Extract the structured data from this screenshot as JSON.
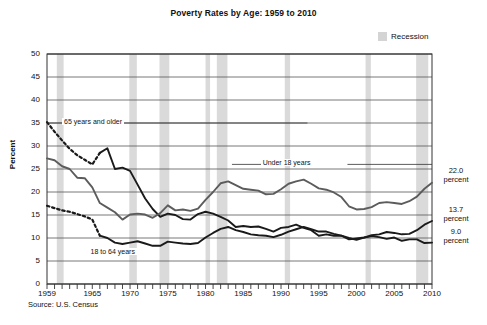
{
  "title": "Poverty Rates by Age: 1959 to 2010",
  "source": "Source: U.S. Census",
  "legend": {
    "recession_label": "Recession",
    "recession_color": "#d4d4d4"
  },
  "axes": {
    "y_title": "Percent",
    "y_ticks": [
      "50",
      "45",
      "40",
      "35",
      "30",
      "25",
      "20",
      "15",
      "10",
      "5",
      "0"
    ],
    "x_ticks": [
      "1959",
      "1965",
      "1970",
      "1975",
      "1980",
      "1985",
      "1990",
      "1995",
      "2000",
      "2005",
      "2010"
    ]
  },
  "series_labels": {
    "older": "65 years and older",
    "under18": "Under 18 years",
    "adults": "18 to 64 years"
  },
  "end_values": {
    "under18": "22.0",
    "under18_unit": "percent",
    "adults": "13.7",
    "adults_unit": "percent",
    "older": "9.0",
    "older_unit": "percent"
  },
  "chart_data": {
    "type": "line",
    "title": "Poverty Rates by Age: 1959 to 2010",
    "xlabel": "",
    "ylabel": "Percent",
    "xlim": [
      1959,
      2010
    ],
    "ylim": [
      0,
      50
    ],
    "ytick_step": 5,
    "grid": "horizontal",
    "legend_position": "top-right",
    "legend_entries": [
      "Recession"
    ],
    "annotations": [
      {
        "text": "65 years and older",
        "x": 1963,
        "y": 35
      },
      {
        "text": "Under 18 years",
        "x": 1988,
        "y": 26
      },
      {
        "text": "18 to 64 years",
        "x": 1967,
        "y": 7
      },
      {
        "text": "22.0 percent",
        "x": 2010.8,
        "y": 22.0
      },
      {
        "text": "13.7 percent",
        "x": 2010.8,
        "y": 13.7
      },
      {
        "text": "9.0 percent",
        "x": 2010.8,
        "y": 9.0
      }
    ],
    "recession_bands": [
      [
        1960.3,
        1961.2
      ],
      [
        1969.9,
        1970.9
      ],
      [
        1973.9,
        1975.2
      ],
      [
        1980.0,
        1980.6
      ],
      [
        1981.5,
        1982.9
      ],
      [
        1990.5,
        1991.2
      ],
      [
        2001.2,
        2001.9
      ],
      [
        2007.9,
        2009.5
      ]
    ],
    "x": [
      1959,
      1960,
      1961,
      1962,
      1963,
      1964,
      1965,
      1966,
      1967,
      1968,
      1969,
      1970,
      1971,
      1972,
      1973,
      1974,
      1975,
      1976,
      1977,
      1978,
      1979,
      1980,
      1981,
      1982,
      1983,
      1984,
      1985,
      1986,
      1987,
      1988,
      1989,
      1990,
      1991,
      1992,
      1993,
      1994,
      1995,
      1996,
      1997,
      1998,
      1999,
      2000,
      2001,
      2002,
      2003,
      2004,
      2005,
      2006,
      2007,
      2008,
      2009,
      2010
    ],
    "series": [
      {
        "name": "65 years and older",
        "color": "#1a1a1a",
        "dashed_until": 1966,
        "values": [
          35.2,
          33.1,
          31.2,
          29.4,
          28.0,
          27.0,
          26.0,
          28.5,
          29.5,
          25.0,
          25.3,
          24.6,
          21.6,
          18.6,
          16.3,
          14.6,
          15.3,
          15.0,
          14.1,
          14.0,
          15.2,
          15.7,
          15.3,
          14.6,
          13.8,
          12.4,
          12.6,
          12.4,
          12.5,
          12.0,
          11.4,
          12.2,
          12.4,
          12.9,
          12.2,
          11.7,
          10.5,
          10.8,
          10.5,
          10.5,
          9.7,
          9.9,
          10.1,
          10.4,
          10.2,
          9.8,
          10.1,
          9.4,
          9.7,
          9.7,
          8.9,
          9.0
        ]
      },
      {
        "name": "Under 18 years",
        "color": "#5c5c5c",
        "dashed_until": 1959,
        "values": [
          27.3,
          26.9,
          25.6,
          25.0,
          23.1,
          23.0,
          21.0,
          17.6,
          16.6,
          15.6,
          14.0,
          15.1,
          15.3,
          15.1,
          14.4,
          15.4,
          17.1,
          16.0,
          16.2,
          15.9,
          16.4,
          18.3,
          20.0,
          21.9,
          22.3,
          21.5,
          20.7,
          20.5,
          20.3,
          19.5,
          19.6,
          20.6,
          21.8,
          22.3,
          22.7,
          21.8,
          20.8,
          20.5,
          19.9,
          18.9,
          16.9,
          16.2,
          16.3,
          16.7,
          17.6,
          17.8,
          17.6,
          17.4,
          18.0,
          19.0,
          20.7,
          22.0
        ]
      },
      {
        "name": "18 to 64 years",
        "color": "#1a1a1a",
        "dashed_until": 1966,
        "values": [
          17.0,
          16.5,
          16.0,
          15.7,
          15.2,
          14.7,
          14.0,
          10.5,
          10.0,
          9.0,
          8.7,
          9.0,
          9.3,
          8.8,
          8.3,
          8.3,
          9.2,
          9.0,
          8.8,
          8.7,
          8.9,
          10.1,
          11.1,
          12.0,
          12.4,
          11.7,
          11.3,
          10.8,
          10.6,
          10.5,
          10.2,
          10.7,
          11.4,
          11.9,
          12.4,
          11.9,
          11.4,
          11.4,
          10.9,
          10.5,
          10.0,
          9.6,
          10.1,
          10.6,
          10.8,
          11.3,
          11.1,
          10.8,
          10.9,
          11.7,
          12.9,
          13.7
        ]
      }
    ]
  }
}
